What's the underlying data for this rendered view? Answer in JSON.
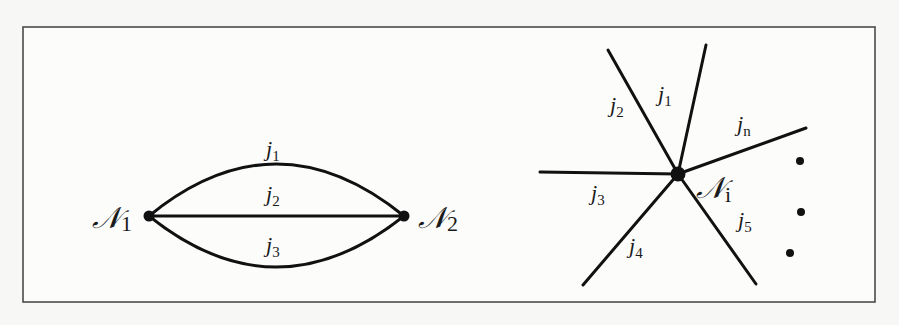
{
  "figure": {
    "left_graph": {
      "nodes": [
        {
          "id": "N1",
          "symbol": "𝒩",
          "subscript": "1",
          "x": 149,
          "y": 216
        },
        {
          "id": "N2",
          "symbol": "𝒩",
          "subscript": "2",
          "x": 404,
          "y": 216
        }
      ],
      "edges": [
        {
          "label": "j",
          "subscript": "1",
          "shape": "upper-arc"
        },
        {
          "label": "j",
          "subscript": "2",
          "shape": "straight"
        },
        {
          "label": "j",
          "subscript": "3",
          "shape": "lower-arc"
        }
      ]
    },
    "right_graph": {
      "center": {
        "id": "Ni",
        "symbol": "𝒩",
        "subscript": "i",
        "x": 678,
        "y": 174
      },
      "edges": [
        {
          "label": "j",
          "subscript": "1"
        },
        {
          "label": "j",
          "subscript": "2"
        },
        {
          "label": "j",
          "subscript": "3"
        },
        {
          "label": "j",
          "subscript": "4"
        },
        {
          "label": "j",
          "subscript": "5"
        },
        {
          "label": "j",
          "subscript": "n"
        }
      ],
      "ellipsis": "⋮"
    }
  }
}
